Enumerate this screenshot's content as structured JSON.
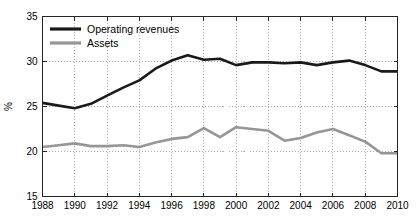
{
  "chart_data": {
    "type": "line",
    "title": "",
    "subtitle": "",
    "xlabel": "",
    "ylabel": "%",
    "xlim": [
      1988,
      2010
    ],
    "ylim": [
      15,
      35
    ],
    "grid": true,
    "legend_position": "top-left",
    "x": [
      1988,
      1989,
      1990,
      1991,
      1992,
      1993,
      1994,
      1995,
      1996,
      1997,
      1998,
      1999,
      2000,
      2001,
      2002,
      2003,
      2004,
      2005,
      2006,
      2007,
      2008,
      2009,
      2010
    ],
    "xticks": [
      "1988",
      "1990",
      "1992",
      "1994",
      "1996",
      "1998",
      "2000",
      "2002",
      "2004",
      "2006",
      "2008",
      "2010"
    ],
    "xtick_values": [
      1988,
      1990,
      1992,
      1994,
      1996,
      1998,
      2000,
      2002,
      2004,
      2006,
      2008,
      2010
    ],
    "yticks": [
      "15",
      "20",
      "25",
      "30",
      "35"
    ],
    "ytick_values": [
      15,
      20,
      25,
      30,
      35
    ],
    "series": [
      {
        "name": "Operating revenues",
        "color": "#1a1a1a",
        "width": 2.6,
        "values": [
          25.4,
          25.1,
          24.8,
          25.3,
          26.2,
          27.1,
          27.9,
          29.2,
          30.1,
          30.7,
          30.2,
          30.3,
          29.6,
          29.9,
          29.9,
          29.8,
          29.9,
          29.6,
          29.9,
          30.1,
          29.6,
          28.9,
          28.9
        ]
      },
      {
        "name": "Assets",
        "color": "#969696",
        "width": 2.6,
        "values": [
          20.5,
          20.7,
          20.9,
          20.6,
          20.6,
          20.7,
          20.5,
          21.0,
          21.4,
          21.6,
          22.6,
          21.6,
          22.7,
          22.5,
          22.3,
          21.2,
          21.5,
          22.1,
          22.5,
          21.8,
          21.1,
          19.8,
          19.8
        ]
      }
    ]
  },
  "legend": {
    "items": [
      {
        "label": "Operating revenues",
        "color": "#1a1a1a"
      },
      {
        "label": "Assets",
        "color": "#969696"
      }
    ]
  },
  "axes": {
    "y_axis_title": "%"
  }
}
